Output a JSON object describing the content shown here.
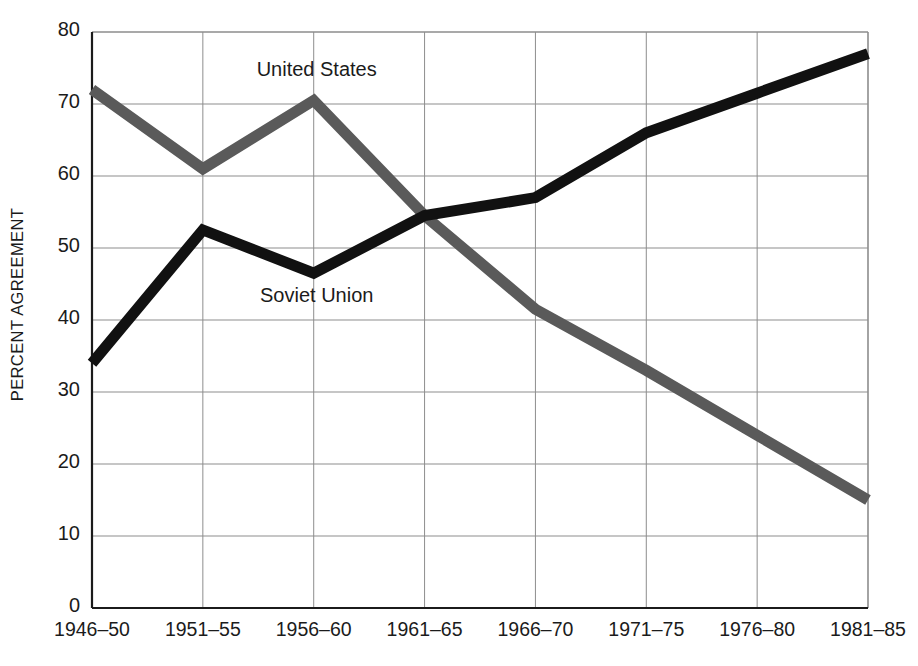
{
  "chart_data": {
    "type": "line",
    "title": "",
    "subtitle": "",
    "xlabel": "",
    "ylabel": "PERCENT AGREEMENT",
    "categories": [
      "1946–50",
      "1951–55",
      "1956–60",
      "1961–65",
      "1966–70",
      "1971–75",
      "1976–80",
      "1981–85"
    ],
    "ylim": [
      0,
      80
    ],
    "yticks": [
      0,
      10,
      20,
      30,
      40,
      50,
      60,
      70,
      80
    ],
    "ytick_labels": [
      "0",
      "10",
      "20",
      "30",
      "40",
      "50",
      "60",
      "70",
      "80"
    ],
    "grid": true,
    "legend_position": "inline-annotation",
    "series": [
      {
        "name": "United States",
        "color": "#5a5a5a",
        "values": [
          72,
          61,
          70.5,
          54.5,
          41.5,
          33,
          24,
          15
        ]
      },
      {
        "name": "Soviet Union",
        "color": "#111111",
        "values": [
          34,
          52.5,
          46.5,
          54.5,
          57,
          66,
          71.5,
          77
        ]
      }
    ],
    "annotations": [
      {
        "text": "United States",
        "x_category": "1956–60",
        "value": 74.5
      },
      {
        "text": "Soviet Union",
        "x_category": "1956–60",
        "value": 43
      }
    ]
  },
  "axis": {
    "y_title": "PERCENT AGREEMENT",
    "y_ticks": [
      "80",
      "70",
      "60",
      "50",
      "40",
      "30",
      "20",
      "10",
      "0"
    ],
    "x_ticks": [
      "1946–50",
      "1951–55",
      "1956–60",
      "1961–65",
      "1966–70",
      "1971–75",
      "1976–80",
      "1981–85"
    ]
  },
  "labels": {
    "united_states": "United States",
    "soviet_union": "Soviet Union"
  },
  "colors": {
    "us_line": "#5a5a5a",
    "su_line": "#111111",
    "grid": "#8d8d8d",
    "axis": "#1b1b1b",
    "background": "#ffffff"
  }
}
